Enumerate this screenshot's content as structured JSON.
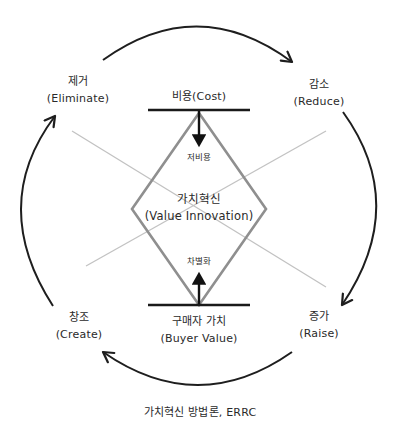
{
  "diagram": {
    "title": "가치혁신 방법론, ERRC",
    "center": {
      "kr": "가치혁신",
      "en": "(Value Innovation)"
    },
    "axes": {
      "top": {
        "kr": "비용",
        "en": "(Cost)",
        "label": "비용(Cost)"
      },
      "bottom": {
        "kr": "구매자 가치",
        "en": "(Buyer Value)"
      }
    },
    "inner_labels": {
      "low_cost": "저비용",
      "differentiation": "차별화"
    },
    "corners": [
      {
        "id": "eliminate",
        "kr": "제거",
        "en": "(Eliminate)",
        "position": "top-left"
      },
      {
        "id": "reduce",
        "kr": "감소",
        "en": "(Reduce)",
        "position": "top-right"
      },
      {
        "id": "raise",
        "kr": "증가",
        "en": "(Raise)",
        "position": "bottom-right"
      },
      {
        "id": "create",
        "kr": "창조",
        "en": "(Create)",
        "position": "bottom-left"
      }
    ],
    "cycle_order": [
      "Eliminate",
      "Reduce",
      "Raise",
      "Create"
    ],
    "colors": {
      "arrows": "#1e1e1e",
      "bars": "#1a1a1a",
      "diamond": "#8f8f8f",
      "cross_lines": "#bdbdbd",
      "text": "#2a2a2a"
    }
  }
}
